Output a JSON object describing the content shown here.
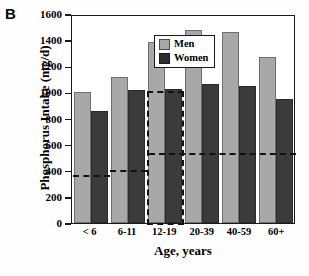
{
  "panel": {
    "letter": "B"
  },
  "chart_data": {
    "type": "bar",
    "title": "",
    "xlabel": "Age, years",
    "ylabel": "Phosphorus Intake (mg/d)",
    "categories": [
      "< 6",
      "6-11",
      "12-19",
      "20-39",
      "40-59",
      "60+"
    ],
    "series": [
      {
        "name": "Men",
        "color": "#a8a8a8",
        "values": [
          1000,
          1118,
          1386,
          1478,
          1463,
          1271
        ]
      },
      {
        "name": "Women",
        "color": "#3b3b3b",
        "values": [
          855,
          1018,
          1026,
          1064,
          1046,
          950
        ]
      }
    ],
    "ylim": [
      0,
      1600
    ],
    "yticks": [
      0,
      200,
      400,
      600,
      800,
      1000,
      1200,
      1400,
      1600
    ],
    "ytick_labels": [
      "0",
      "200",
      "400",
      "600",
      "800",
      "1000",
      "1200",
      "1400",
      "1600"
    ],
    "grid": false,
    "legend_position": "top-left",
    "legend": [
      "Men",
      "Women"
    ],
    "annotations": [
      {
        "type": "reference-line",
        "name": "rda-children-low",
        "value": 380,
        "x_from": "< 6",
        "x_to": "6-11",
        "style": "dashed"
      },
      {
        "type": "reference-line",
        "name": "rda-children-high",
        "value": 420,
        "x_from": "6-11",
        "x_to": "12-19",
        "style": "dashed"
      },
      {
        "type": "reference-box",
        "name": "rda-adolescent-box",
        "value": 1025,
        "x_from": "12-19",
        "x_to": "12-19",
        "style": "dashed"
      },
      {
        "type": "reference-line",
        "name": "rda-adults",
        "value": 550,
        "x_from": "12-19",
        "x_to": "60+",
        "style": "dashed"
      }
    ]
  }
}
